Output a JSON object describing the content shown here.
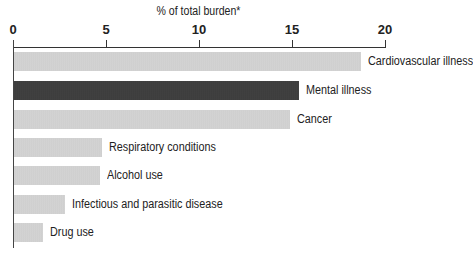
{
  "chart_data": {
    "type": "bar",
    "orientation": "horizontal",
    "title": "% of total burden*",
    "xlabel": "% of total burden*",
    "ylabel": "",
    "xlim": [
      0,
      20
    ],
    "xticks": [
      "0",
      "5",
      "10",
      "15",
      "20"
    ],
    "axis_position": "top",
    "grid": false,
    "legend": null,
    "categories": [
      "Cardiovascular illness",
      "Mental illness",
      "Cancer",
      "Respiratory conditions",
      "Alcohol use",
      "Infectious and parasitic disease",
      "Drug use"
    ],
    "values": [
      18.7,
      15.4,
      14.9,
      4.8,
      4.7,
      2.8,
      1.6
    ],
    "highlighted": "Mental illness",
    "colors": {
      "default": "#cfcfcf",
      "highlight": "#3d3d3d"
    }
  },
  "labels": {
    "title": "% of total burden*",
    "ticks": [
      "0",
      "5",
      "10",
      "15",
      "20"
    ],
    "bars": [
      "Cardiovascular illness",
      "Mental illness",
      "Cancer",
      "Respiratory conditions",
      "Alcohol use",
      "Infectious and parasitic disease",
      "Drug use"
    ]
  }
}
